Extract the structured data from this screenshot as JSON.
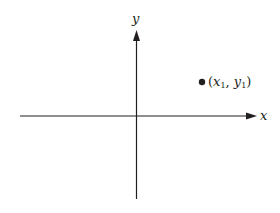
{
  "diagram": {
    "type": "cartesian-axes-with-point",
    "axes": {
      "x_label": "x",
      "y_label": "y",
      "color": "#231f20"
    },
    "point": {
      "label_open": "(",
      "x_var": "x",
      "x_sub": "1",
      "sep": ", ",
      "y_var": "y",
      "y_sub": "1",
      "label_close": ")",
      "position": "first quadrant"
    }
  }
}
